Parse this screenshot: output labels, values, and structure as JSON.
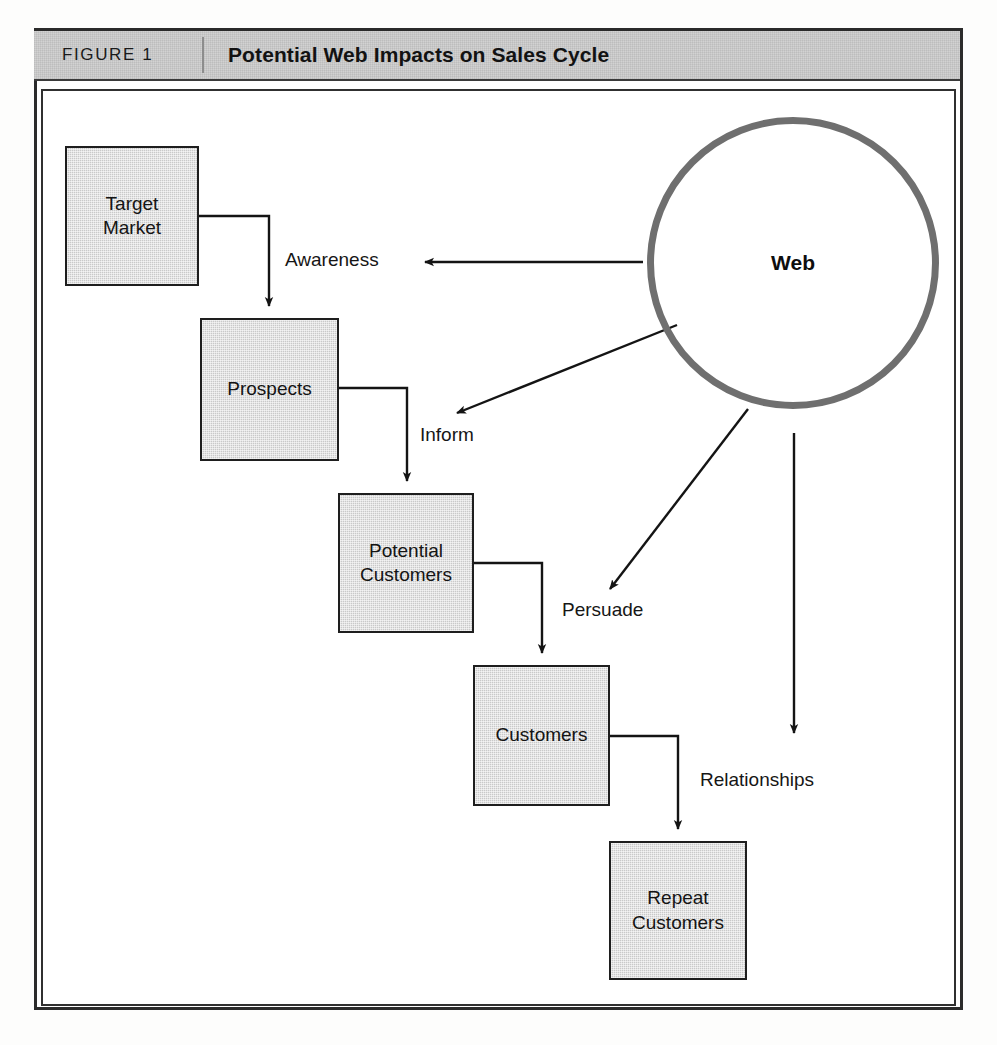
{
  "figure": {
    "label": "FIGURE 1",
    "title": "Potential Web Impacts on Sales Cycle"
  },
  "diagram": {
    "type": "flow-diagram",
    "hub": {
      "id": "web",
      "label": "Web",
      "shape": "circle",
      "cx": 750,
      "cy": 172,
      "r": 146
    },
    "nodes": [
      {
        "id": "target-market",
        "line1": "Target",
        "line2": "Market",
        "x": 22,
        "y": 55,
        "w": 134,
        "h": 140
      },
      {
        "id": "prospects",
        "line1": "Prospects",
        "line2": "",
        "x": 157,
        "y": 227,
        "w": 139,
        "h": 143
      },
      {
        "id": "potential-customers",
        "line1": "Potential",
        "line2": "Customers",
        "x": 295,
        "y": 402,
        "w": 136,
        "h": 140
      },
      {
        "id": "customers",
        "line1": "Customers",
        "line2": "",
        "x": 430,
        "y": 574,
        "w": 137,
        "h": 141
      },
      {
        "id": "repeat-customers",
        "line1": "Repeat",
        "line2": "Customers",
        "x": 566,
        "y": 750,
        "w": 138,
        "h": 139
      }
    ],
    "chain_edges": [
      {
        "id": "target-to-prospects",
        "from": "target-market",
        "to": "prospects"
      },
      {
        "id": "prospects-to-potential",
        "from": "prospects",
        "to": "potential-customers"
      },
      {
        "id": "potential-to-customers",
        "from": "potential-customers",
        "to": "customers"
      },
      {
        "id": "customers-to-repeat",
        "from": "customers",
        "to": "repeat-customers"
      }
    ],
    "web_edges": [
      {
        "id": "awareness",
        "label": "Awareness",
        "from": "web",
        "to": "target-market-flow",
        "label_x": 242,
        "label_y": 158
      },
      {
        "id": "inform",
        "label": "Inform",
        "from": "web",
        "to": "prospects-flow",
        "label_x": 377,
        "label_y": 333
      },
      {
        "id": "persuade",
        "label": "Persuade",
        "from": "web",
        "to": "potential-flow",
        "label_x": 519,
        "label_y": 508
      },
      {
        "id": "relationships",
        "label": "Relationships",
        "from": "web",
        "to": "customers-flow",
        "label_x": 657,
        "label_y": 678
      }
    ]
  }
}
